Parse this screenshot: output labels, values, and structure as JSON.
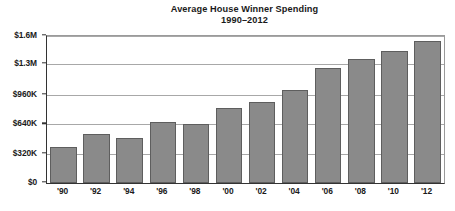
{
  "chart_data": {
    "type": "bar",
    "title": "Average House Winner Spending",
    "subtitle": "1990–2012",
    "xlabel": "",
    "ylabel": "",
    "categories": [
      "'90",
      "'92",
      "'94",
      "'96",
      "'98",
      "'00",
      "'02",
      "'04",
      "'06",
      "'08",
      "'10",
      "'12"
    ],
    "values": [
      390000,
      530000,
      490000,
      660000,
      640000,
      820000,
      880000,
      1010000,
      1250000,
      1350000,
      1440000,
      1550000
    ],
    "ylim": [
      0,
      1600000
    ],
    "ytick_values": [
      0,
      320000,
      640000,
      960000,
      1300000,
      1600000
    ],
    "ytick_labels": [
      "$0",
      "$320K",
      "$640K",
      "$960K",
      "$1.3M",
      "$1.6M"
    ],
    "grid": true,
    "legend": null,
    "bar_color": "#8a8a8a",
    "bar_border_color": "#5e5e5e",
    "gridline_color": "#a8a8a8",
    "axis_color": "#333333",
    "background_color": "#ffffff"
  }
}
